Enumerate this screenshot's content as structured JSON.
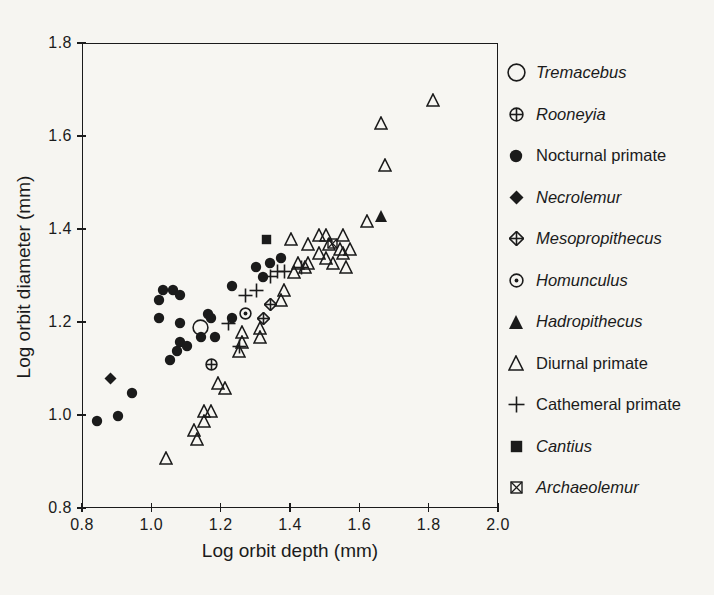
{
  "figure": {
    "background": "#f6f5f1",
    "ink": "#1b1b1b"
  },
  "chart_data": {
    "type": "scatter",
    "title": "",
    "xlabel": "Log orbit depth (mm)",
    "ylabel": "Log orbit diameter (mm)",
    "xlim": [
      0.8,
      2.0
    ],
    "ylim": [
      0.8,
      1.8
    ],
    "xticks": [
      "0.8",
      "1.0",
      "1.2",
      "1.4",
      "1.6",
      "1.8",
      "2.0"
    ],
    "yticks": [
      "0.8",
      "1.0",
      "1.2",
      "1.4",
      "1.6",
      "1.8"
    ],
    "grid": false,
    "legend_position": "right",
    "series": [
      {
        "name": "Tremacebus",
        "marker": "open-circle-large",
        "italic": true,
        "points": [
          [
            1.14,
            1.19
          ]
        ]
      },
      {
        "name": "Rooneyia",
        "marker": "circle-plus",
        "italic": true,
        "points": [
          [
            1.17,
            1.11
          ]
        ]
      },
      {
        "name": "Nocturnal primate",
        "marker": "filled-circle",
        "italic": false,
        "points": [
          [
            0.84,
            0.99
          ],
          [
            0.9,
            1.0
          ],
          [
            0.94,
            1.05
          ],
          [
            1.02,
            1.21
          ],
          [
            1.02,
            1.25
          ],
          [
            1.03,
            1.27
          ],
          [
            1.06,
            1.27
          ],
          [
            1.08,
            1.26
          ],
          [
            1.08,
            1.2
          ],
          [
            1.05,
            1.12
          ],
          [
            1.07,
            1.14
          ],
          [
            1.08,
            1.16
          ],
          [
            1.1,
            1.15
          ],
          [
            1.14,
            1.17
          ],
          [
            1.16,
            1.22
          ],
          [
            1.17,
            1.21
          ],
          [
            1.18,
            1.17
          ],
          [
            1.23,
            1.28
          ],
          [
            1.23,
            1.21
          ],
          [
            1.3,
            1.32
          ],
          [
            1.32,
            1.3
          ],
          [
            1.34,
            1.33
          ],
          [
            1.37,
            1.34
          ]
        ]
      },
      {
        "name": "Necrolemur",
        "marker": "filled-diamond",
        "italic": true,
        "points": [
          [
            0.88,
            1.08
          ]
        ]
      },
      {
        "name": "Mesopropithecus",
        "marker": "diamond-plus",
        "italic": true,
        "points": [
          [
            1.34,
            1.24
          ],
          [
            1.32,
            1.21
          ]
        ]
      },
      {
        "name": "Homunculus",
        "marker": "circle-dot",
        "italic": true,
        "points": [
          [
            1.27,
            1.22
          ]
        ]
      },
      {
        "name": "Hadropithecus",
        "marker": "filled-triangle",
        "italic": true,
        "points": [
          [
            1.66,
            1.43
          ]
        ]
      },
      {
        "name": "Diurnal primate",
        "marker": "open-triangle",
        "italic": false,
        "points": [
          [
            1.04,
            0.91
          ],
          [
            1.12,
            0.97
          ],
          [
            1.13,
            0.95
          ],
          [
            1.15,
            0.99
          ],
          [
            1.15,
            1.01
          ],
          [
            1.17,
            1.01
          ],
          [
            1.19,
            1.07
          ],
          [
            1.21,
            1.06
          ],
          [
            1.25,
            1.14
          ],
          [
            1.26,
            1.16
          ],
          [
            1.26,
            1.18
          ],
          [
            1.31,
            1.17
          ],
          [
            1.31,
            1.19
          ],
          [
            1.37,
            1.25
          ],
          [
            1.38,
            1.27
          ],
          [
            1.41,
            1.31
          ],
          [
            1.42,
            1.33
          ],
          [
            1.44,
            1.32
          ],
          [
            1.4,
            1.38
          ],
          [
            1.45,
            1.37
          ],
          [
            1.45,
            1.33
          ],
          [
            1.48,
            1.39
          ],
          [
            1.5,
            1.39
          ],
          [
            1.48,
            1.35
          ],
          [
            1.5,
            1.34
          ],
          [
            1.51,
            1.37
          ],
          [
            1.52,
            1.33
          ],
          [
            1.54,
            1.36
          ],
          [
            1.55,
            1.39
          ],
          [
            1.55,
            1.35
          ],
          [
            1.57,
            1.36
          ],
          [
            1.56,
            1.32
          ],
          [
            1.62,
            1.42
          ],
          [
            1.66,
            1.63
          ],
          [
            1.67,
            1.54
          ],
          [
            1.81,
            1.68
          ]
        ]
      },
      {
        "name": "Cathemeral primate",
        "marker": "plus",
        "italic": false,
        "points": [
          [
            1.22,
            1.2
          ],
          [
            1.25,
            1.15
          ],
          [
            1.27,
            1.26
          ],
          [
            1.3,
            1.27
          ],
          [
            1.34,
            1.3
          ],
          [
            1.36,
            1.31
          ],
          [
            1.38,
            1.31
          ],
          [
            1.43,
            1.32
          ]
        ]
      },
      {
        "name": "Cantius",
        "marker": "filled-square",
        "italic": true,
        "points": [
          [
            1.33,
            1.38
          ]
        ]
      },
      {
        "name": "Archaeolemur",
        "marker": "square-x",
        "italic": true,
        "points": [
          [
            1.52,
            1.37
          ]
        ]
      }
    ]
  }
}
